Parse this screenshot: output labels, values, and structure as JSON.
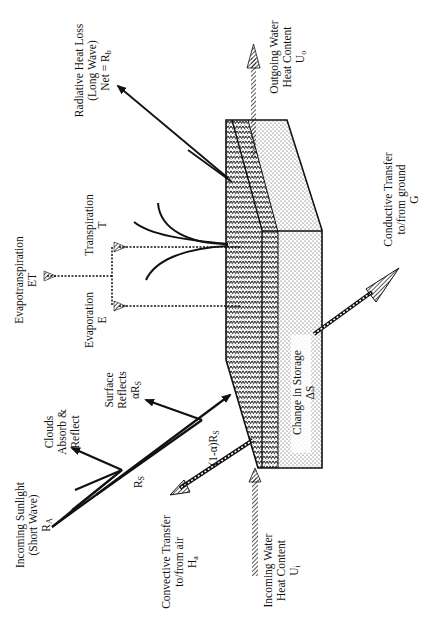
{
  "diagram": {
    "orientation": "rotated 90 degrees counter-clockwise",
    "colors": {
      "ink": "#111111",
      "background": "#ffffff"
    },
    "labels": {
      "incoming_sunlight": {
        "line1": "Incoming Sunlight",
        "line2": "(Short Wave)",
        "line3": "R",
        "sub": "A"
      },
      "clouds": {
        "line1": "Clouds",
        "line2": "Absorb &",
        "line3": "Reflect"
      },
      "rs": {
        "text": "R",
        "sub": "S"
      },
      "surface_reflects": {
        "line1": "Surface",
        "line2": "Reflects",
        "line3": "αR",
        "sub": "S"
      },
      "absorbed": {
        "text": "(1-α)R",
        "sub": "S"
      },
      "convective": {
        "line1": "Convective Transfer",
        "line2": "to/from air",
        "line3": "H",
        "sub": "a"
      },
      "incoming_water": {
        "line1": "Incoming Water",
        "line2": "Heat Content",
        "line3": "U",
        "sub": "i"
      },
      "change_storage": {
        "line1": "Change in Storage",
        "line2": "ΔS"
      },
      "conductive": {
        "line1": "Conductive Transfer",
        "line2": "to/from ground",
        "line3": "G"
      },
      "outgoing_water": {
        "line1": "Outgoing Water",
        "line2": "Heat Content",
        "line3": "U",
        "sub": "o"
      },
      "radiative": {
        "line1": "Radiative Heat Loss",
        "line2": "(Long Wave)",
        "line3": "Net = R",
        "sub": "b"
      },
      "evapotranspiration": {
        "line1": "Evapotranspiration",
        "line2": "ET"
      },
      "transpiration": {
        "line1": "Transpiration",
        "line2": "T"
      },
      "evaporation": {
        "line1": "Evaporation",
        "line2": "E"
      }
    }
  }
}
